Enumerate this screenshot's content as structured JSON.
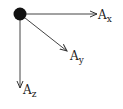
{
  "diagram": {
    "type": "vector-components",
    "origin": {
      "label": ""
    },
    "vectors": [
      {
        "name": "x",
        "label": "A",
        "subscript": "x"
      },
      {
        "name": "y",
        "label": "A",
        "subscript": "y"
      },
      {
        "name": "z",
        "label": "A",
        "subscript": "z"
      }
    ],
    "colors": {
      "ink": "#222222",
      "background": "#ffffff"
    }
  }
}
